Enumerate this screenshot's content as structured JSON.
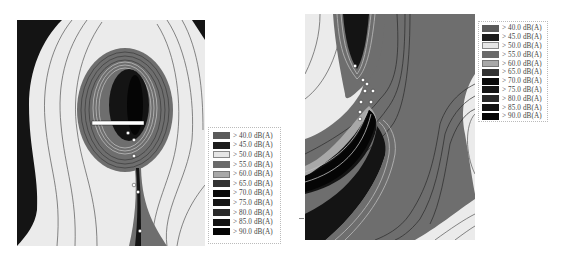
{
  "figures": [
    {
      "id": "left",
      "description": "Noise contour map with oval high-noise zone and narrow tail"
    },
    {
      "id": "right",
      "description": "Noise contour map with two high-noise lobes connected at center"
    }
  ],
  "legend_left": {
    "items": [
      {
        "label": "> 40.0 dB(A)",
        "color": "#5a5a5a"
      },
      {
        "label": "> 45.0 dB(A)",
        "color": "#1c1c1c"
      },
      {
        "label": "> 50.0 dB(A)",
        "color": "#e6e6e6"
      },
      {
        "label": "> 55.0 dB(A)",
        "color": "#6a6a6a"
      },
      {
        "label": "> 60.0 dB(A)",
        "color": "#a8a8a8"
      },
      {
        "label": "> 65.0 dB(A)",
        "color": "#333333"
      },
      {
        "label": "> 70.0 dB(A)",
        "color": "#0a0a0a"
      },
      {
        "label": "> 75.0 dB(A)",
        "color": "#151515"
      },
      {
        "label": "> 80.0 dB(A)",
        "color": "#2a2a2a"
      },
      {
        "label": "> 85.0 dB(A)",
        "color": "#121212"
      },
      {
        "label": "> 90.0 dB(A)",
        "color": "#050505"
      }
    ]
  },
  "legend_right": {
    "items": [
      {
        "label": "> 40.0 dB(A)",
        "color": "#5a5a5a"
      },
      {
        "label": "> 45.0 dB(A)",
        "color": "#1c1c1c"
      },
      {
        "label": "> 50.0 dB(A)",
        "color": "#e6e6e6"
      },
      {
        "label": "> 55.0 dB(A)",
        "color": "#6a6a6a"
      },
      {
        "label": "> 60.0 dB(A)",
        "color": "#a8a8a8"
      },
      {
        "label": "> 65.0 dB(A)",
        "color": "#333333"
      },
      {
        "label": "> 70.0 dB(A)",
        "color": "#0a0a0a"
      },
      {
        "label": "> 75.0 dB(A)",
        "color": "#151515"
      },
      {
        "label": "> 80.0 dB(A)",
        "color": "#2a2a2a"
      },
      {
        "label": "> 85.0 dB(A)",
        "color": "#121212"
      },
      {
        "label": "> 90.0 dB(A)",
        "color": "#050505"
      }
    ]
  },
  "colors": {
    "background_light": "#ebebeb",
    "mid_gray": "#6e6e6e",
    "dark": "#141414",
    "contour_line": "#3a3a3a"
  }
}
